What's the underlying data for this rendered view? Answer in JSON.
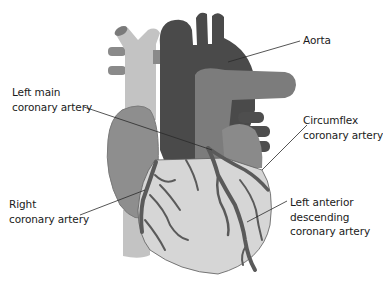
{
  "diagram": {
    "colors": {
      "background": "#ffffff",
      "aorta": "#4a4a4a",
      "pulmonary_artery": "#7c7c7c",
      "vena_cava": "#c3c3c3",
      "right_atrium": "#8e8e8e",
      "left_atrium": "#8a8a8a",
      "ventricles": "#d6d6d6",
      "coronary_vessels": "#5a5a5a",
      "outline": "#6a6a6a",
      "leader_line": "#2a2a2a",
      "label_text": "#1a1a1a"
    },
    "labels": [
      {
        "id": "aorta",
        "lines": [
          "Aorta"
        ]
      },
      {
        "id": "left-main",
        "lines": [
          "Left main",
          "coronary artery"
        ]
      },
      {
        "id": "circumflex",
        "lines": [
          "Circumflex",
          "coronary artery"
        ]
      },
      {
        "id": "right",
        "lines": [
          "Right",
          "coronary artery"
        ]
      },
      {
        "id": "lad",
        "lines": [
          "Left anterior",
          "descending",
          "coronary artery"
        ]
      }
    ]
  }
}
